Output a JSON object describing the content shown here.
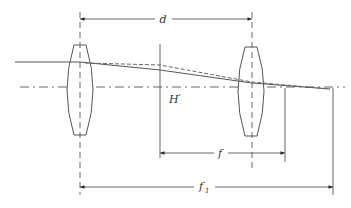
{
  "diagram": {
    "labels": {
      "separation": "d",
      "principal_plane": "H",
      "principal_plane_mark": "'",
      "effective_focal_length": "f",
      "front_focal_length_main": "f",
      "front_focal_length_sub": "1"
    },
    "elements": [
      {
        "id": "lens-1",
        "type": "biconvex lens"
      },
      {
        "id": "lens-2",
        "type": "biconvex lens"
      },
      {
        "id": "optical-axis",
        "type": "dash-dot line"
      },
      {
        "id": "ray-actual",
        "type": "solid ray"
      },
      {
        "id": "ray-extended",
        "type": "dashed ray"
      }
    ],
    "colors": {
      "line": "#555555",
      "background": "#ffffff"
    }
  }
}
